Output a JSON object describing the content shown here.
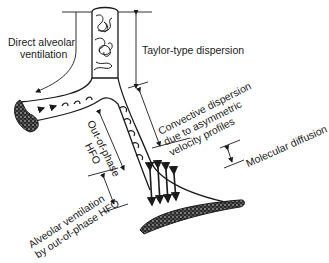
{
  "diagram": {
    "labels": {
      "direct_alveolar": [
        "Direct alveolar",
        "ventilation"
      ],
      "taylor": "Taylor-type dispersion",
      "convective": [
        "Convective dispersion",
        "due to asymmetric",
        "velocity profiles"
      ],
      "out_of_phase": [
        "Out-of-phase",
        "HFO"
      ],
      "molecular": "Molecular diffusion",
      "alveolar_ventilation": [
        "Alveolar ventilation",
        "by out-of-phase HFO"
      ]
    },
    "colors": {
      "ink": "#1a1a1a",
      "background": "#ffffff",
      "stipple": "#3a3a3a"
    }
  }
}
